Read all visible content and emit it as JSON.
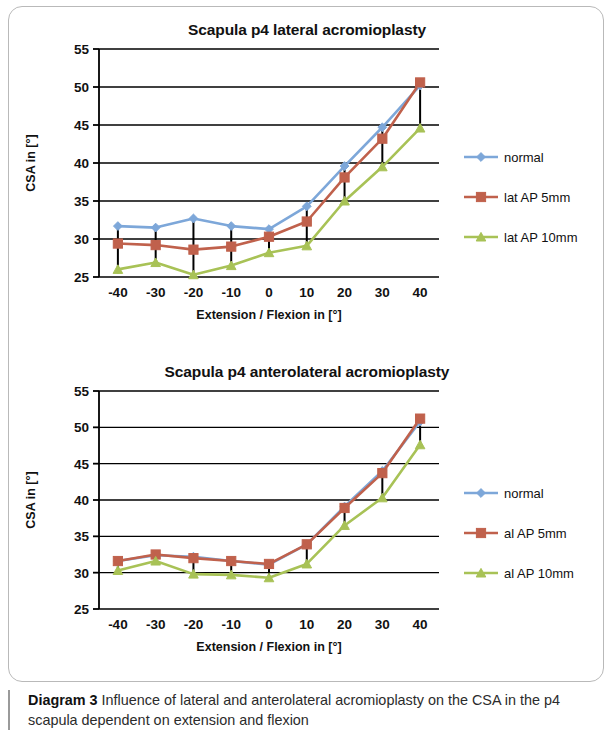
{
  "figure": {
    "caption_label": "Diagram 3",
    "caption_text": " Influence of lateral and anterolateral acromioplasty on the CSA in the p4 scapula dependent on extension and flexion"
  },
  "colors": {
    "normal": "#7da7d9",
    "ap5": "#c0614c",
    "ap10": "#a8c256",
    "axis": "#000000",
    "grid": "#000000",
    "errorbar": "#000000",
    "card_border": "#b9b9b9"
  },
  "chart_data": [
    {
      "type": "line",
      "title": "Scapula p4 lateral acromioplasty",
      "xlabel": "Extension / Flexion in [°]",
      "ylabel": "CSA in [°]",
      "categories": [
        "-40",
        "-30",
        "-20",
        "-10",
        "0",
        "10",
        "20",
        "30",
        "40"
      ],
      "x": [
        -40,
        -30,
        -20,
        -10,
        0,
        10,
        20,
        30,
        40
      ],
      "ylim": [
        25,
        55
      ],
      "yticks": [
        25,
        30,
        35,
        40,
        45,
        50,
        55
      ],
      "grid": true,
      "legend_position": "right",
      "series": [
        {
          "name": "normal",
          "color": "#7da7d9",
          "marker": "diamond",
          "values": [
            31.7,
            31.5,
            32.7,
            31.7,
            31.3,
            34.3,
            39.6,
            44.7,
            50.2
          ]
        },
        {
          "name": "lat AP 5mm",
          "color": "#c0614c",
          "marker": "square",
          "values": [
            29.4,
            29.2,
            28.6,
            29.0,
            30.3,
            32.3,
            38.1,
            43.2,
            50.6
          ]
        },
        {
          "name": "lat AP 10mm",
          "color": "#a8c256",
          "marker": "triangle",
          "values": [
            26.0,
            26.9,
            25.3,
            26.5,
            28.2,
            29.1,
            35.0,
            39.5,
            44.6
          ]
        }
      ],
      "error_bars": [
        {
          "x": -40,
          "low": 25.5,
          "high": 31.7
        },
        {
          "x": -30,
          "low": 26.9,
          "high": 31.5
        },
        {
          "x": -20,
          "low": 25.2,
          "high": 32.7
        },
        {
          "x": -10,
          "low": 26.5,
          "high": 31.7
        },
        {
          "x": 0,
          "low": 28.2,
          "high": 31.3
        },
        {
          "x": 10,
          "low": 29.1,
          "high": 34.3
        },
        {
          "x": 20,
          "low": 35.0,
          "high": 39.6
        },
        {
          "x": 30,
          "low": 39.5,
          "high": 44.7
        },
        {
          "x": 40,
          "low": 44.6,
          "high": 50.6
        }
      ]
    },
    {
      "type": "line",
      "title": "Scapula p4 anterolateral acromioplasty",
      "xlabel": "Extension / Flexion in [°]",
      "ylabel": "CSA in [°]",
      "categories": [
        "-40",
        "-30",
        "-20",
        "-10",
        "0",
        "10",
        "20",
        "30",
        "40"
      ],
      "x": [
        -40,
        -30,
        -20,
        -10,
        0,
        10,
        20,
        30,
        40
      ],
      "ylim": [
        25,
        55
      ],
      "yticks": [
        25,
        30,
        35,
        40,
        45,
        50,
        55
      ],
      "grid": true,
      "legend_position": "right",
      "series": [
        {
          "name": "normal",
          "color": "#7da7d9",
          "marker": "diamond",
          "values": [
            31.6,
            32.4,
            32.2,
            31.6,
            31.1,
            33.9,
            39.1,
            44.0,
            50.8
          ]
        },
        {
          "name": "al AP 5mm",
          "color": "#c0614c",
          "marker": "square",
          "values": [
            31.6,
            32.5,
            32.0,
            31.6,
            31.2,
            33.9,
            38.9,
            43.7,
            51.2
          ]
        },
        {
          "name": "al AP 10mm",
          "color": "#a8c256",
          "marker": "triangle",
          "values": [
            30.3,
            31.6,
            29.8,
            29.7,
            29.3,
            31.2,
            36.5,
            40.3,
            47.6
          ]
        }
      ],
      "error_bars": [
        {
          "x": -40,
          "low": 30.3,
          "high": 31.6
        },
        {
          "x": -30,
          "low": 31.6,
          "high": 32.5
        },
        {
          "x": -20,
          "low": 29.8,
          "high": 32.2
        },
        {
          "x": -10,
          "low": 29.7,
          "high": 31.6
        },
        {
          "x": 0,
          "low": 29.3,
          "high": 31.2
        },
        {
          "x": 10,
          "low": 31.2,
          "high": 33.9
        },
        {
          "x": 20,
          "low": 36.5,
          "high": 39.1
        },
        {
          "x": 30,
          "low": 40.3,
          "high": 44.0
        },
        {
          "x": 40,
          "low": 47.6,
          "high": 51.2
        }
      ]
    }
  ]
}
